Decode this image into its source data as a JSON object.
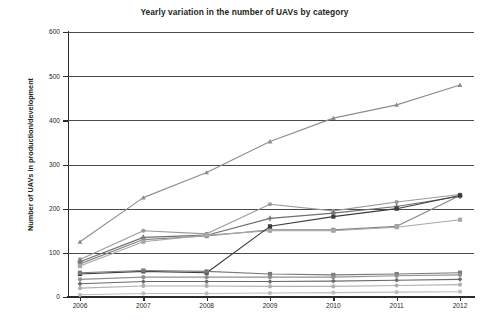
{
  "chart_data": {
    "type": "line",
    "title": "Yearly variation in the number of UAVs by category",
    "xlabel": "",
    "ylabel": "Number of UAVs in production/development",
    "categories": [
      "2006",
      "2007",
      "2008",
      "2009",
      "2010",
      "2011",
      "2012"
    ],
    "x": [
      2006,
      2007,
      2008,
      2009,
      2010,
      2011,
      2012
    ],
    "ylim": [
      0,
      600
    ],
    "yticks": [
      0,
      100,
      200,
      300,
      400,
      500,
      600
    ],
    "ytick_labels": [
      "0",
      "100",
      "200",
      "300",
      "400",
      "500",
      "600"
    ],
    "grid": true,
    "grid_axis": "y",
    "legend": false,
    "legend_position": "none",
    "background": "#ffffff",
    "series": [
      {
        "name": "series-1",
        "values": [
          125,
          225,
          282,
          352,
          405,
          435,
          480
        ],
        "color": "#8d8d8d",
        "marker": "triangle"
      },
      {
        "name": "series-2",
        "values": [
          85,
          150,
          143,
          210,
          195,
          215,
          232
        ],
        "color": "#9a9a9a",
        "marker": "circle"
      },
      {
        "name": "series-3",
        "values": [
          80,
          135,
          140,
          178,
          190,
          205,
          228
        ],
        "color": "#6f6f6f",
        "marker": "plus"
      },
      {
        "name": "series-4",
        "values": [
          75,
          130,
          138,
          152,
          152,
          160,
          230
        ],
        "color": "#858585",
        "marker": "square"
      },
      {
        "name": "series-5",
        "values": [
          70,
          125,
          140,
          150,
          150,
          158,
          175
        ],
        "color": "#a8a8a8",
        "marker": "square"
      },
      {
        "name": "series-6",
        "values": [
          52,
          58,
          55,
          160,
          182,
          200,
          230
        ],
        "color": "#3c3c3c",
        "marker": "square"
      },
      {
        "name": "series-7",
        "values": [
          55,
          60,
          58,
          52,
          50,
          52,
          55
        ],
        "color": "#7a7a7a",
        "marker": "square"
      },
      {
        "name": "series-8",
        "values": [
          40,
          45,
          45,
          45,
          45,
          48,
          50
        ],
        "color": "#909090",
        "marker": "circle"
      },
      {
        "name": "series-9",
        "values": [
          30,
          35,
          35,
          35,
          36,
          38,
          40
        ],
        "color": "#6a6a6a",
        "marker": "diamond"
      },
      {
        "name": "series-10",
        "values": [
          20,
          25,
          25,
          24,
          24,
          26,
          28
        ],
        "color": "#b0b0b0",
        "marker": "circle"
      },
      {
        "name": "series-11",
        "values": [
          5,
          8,
          8,
          9,
          10,
          11,
          12
        ],
        "color": "#bdbdbd",
        "marker": "circle"
      }
    ]
  }
}
